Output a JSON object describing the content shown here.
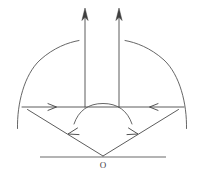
{
  "figure": {
    "background_color": "#ffffff",
    "line_color": "#4a4a4a",
    "arc_color": "#555555",
    "baseline_color": "#6b6b6b",
    "label_color": "#3a3a3a",
    "width": 204,
    "height": 173
  },
  "labels": {
    "origin_point": "O"
  },
  "elements": {
    "baseline_name": "horizontal baseline",
    "left_ray_name": "left ray from O",
    "right_ray_name": "right ray from O",
    "horizontal_line_name": "horizontal chord line",
    "left_vertical_arrow_name": "left vertical arrow",
    "right_vertical_arrow_name": "right vertical arrow",
    "large_arc_name": "large wavefront arc",
    "small_arc_name": "small central arc"
  },
  "geometry": {
    "origin": {
      "x": 103,
      "y": 157
    },
    "baseline": {
      "x1": 40,
      "y1": 157,
      "x2": 166,
      "y2": 157
    },
    "chord_line": {
      "x1": 22,
      "y1": 107,
      "x2": 184,
      "y2": 107
    },
    "left_vertical_arrow": {
      "x": 85,
      "y_bottom": 107,
      "y_top": 10
    },
    "right_vertical_arrow": {
      "x": 119,
      "y_bottom": 107,
      "y_top": 10
    },
    "large_arc": {
      "center_x": 103,
      "center_y": 125,
      "radius": 86
    },
    "small_arc": {
      "center_x": 103,
      "center_y": 128,
      "radius": 28
    },
    "left_ray": {
      "x1": 103,
      "y1": 157,
      "x2": 28,
      "y2": 110
    },
    "right_ray": {
      "x1": 103,
      "y1": 157,
      "x2": 178,
      "y2": 110
    }
  }
}
